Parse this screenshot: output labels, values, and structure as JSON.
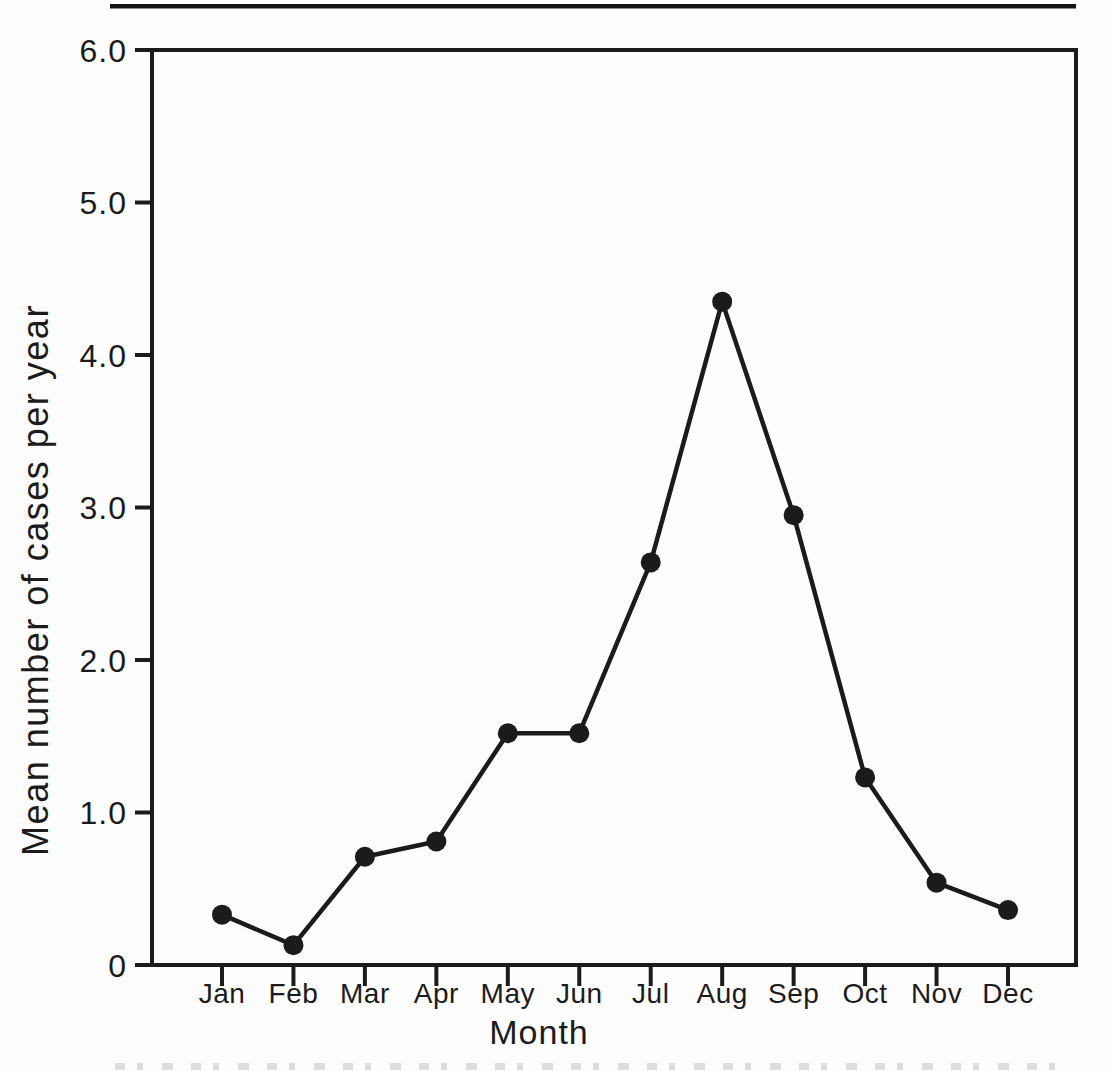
{
  "page": {
    "background_color": "#fdfdfd",
    "ink_color": "#1b1b1b"
  },
  "chart_data": {
    "type": "line",
    "title": "",
    "xlabel": "Month",
    "ylabel": "Mean number of cases per year",
    "categories": [
      "Jan",
      "Feb",
      "Mar",
      "Apr",
      "May",
      "Jun",
      "Jul",
      "Aug",
      "Sep",
      "Oct",
      "Nov",
      "Dec"
    ],
    "values": [
      0.33,
      0.13,
      0.71,
      0.81,
      1.52,
      1.52,
      2.64,
      4.35,
      2.95,
      1.23,
      0.54,
      0.36
    ],
    "series_name": "Mean number of cases per year",
    "ylim": [
      0,
      6
    ],
    "ytick_values": [
      0,
      1,
      2,
      3,
      4,
      5,
      6
    ],
    "ytick_labels": [
      "0",
      "1.0",
      "2.0",
      "3.0",
      "4.0",
      "5.0",
      "6.0"
    ],
    "grid": false,
    "legend": "none",
    "marker": "filled-circle",
    "line_color": "#1b1b1b",
    "marker_color": "#1b1b1b"
  }
}
